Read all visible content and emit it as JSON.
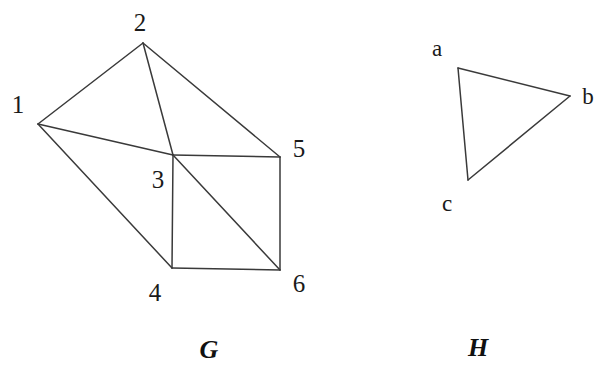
{
  "figure": {
    "background_color": "#ffffff",
    "line_color": "#3a3a3a",
    "text_color": "#1a1a1a",
    "width": 607,
    "height": 384
  },
  "graphs": [
    {
      "id": "G",
      "caption": "G",
      "caption_pos": {
        "x": 209,
        "y": 350
      },
      "vertices": [
        {
          "id": "1",
          "label": "1",
          "x": 38,
          "y": 124,
          "label_x": 18,
          "label_y": 104
        },
        {
          "id": "2",
          "label": "2",
          "x": 143,
          "y": 43,
          "label_x": 140,
          "label_y": 22
        },
        {
          "id": "3",
          "label": "3",
          "x": 173,
          "y": 155,
          "label_x": 158,
          "label_y": 179
        },
        {
          "id": "4",
          "label": "4",
          "x": 172,
          "y": 268,
          "label_x": 155,
          "label_y": 292
        },
        {
          "id": "5",
          "label": "5",
          "x": 280,
          "y": 157,
          "label_x": 299,
          "label_y": 148
        },
        {
          "id": "6",
          "label": "6",
          "x": 280,
          "y": 270,
          "label_x": 299,
          "label_y": 283
        }
      ],
      "edges": [
        {
          "from": "1",
          "to": "2"
        },
        {
          "from": "1",
          "to": "3"
        },
        {
          "from": "1",
          "to": "4"
        },
        {
          "from": "2",
          "to": "3"
        },
        {
          "from": "2",
          "to": "5"
        },
        {
          "from": "3",
          "to": "4"
        },
        {
          "from": "3",
          "to": "5"
        },
        {
          "from": "3",
          "to": "6"
        },
        {
          "from": "4",
          "to": "6"
        },
        {
          "from": "5",
          "to": "6"
        }
      ]
    },
    {
      "id": "H",
      "caption": "H",
      "caption_pos": {
        "x": 478,
        "y": 348
      },
      "vertices": [
        {
          "id": "a",
          "label": "a",
          "x": 458,
          "y": 68,
          "label_x": 437,
          "label_y": 48
        },
        {
          "id": "b",
          "label": "b",
          "x": 570,
          "y": 96,
          "label_x": 588,
          "label_y": 96
        },
        {
          "id": "c",
          "label": "c",
          "x": 468,
          "y": 180,
          "label_x": 447,
          "label_y": 203
        }
      ],
      "edges": [
        {
          "from": "a",
          "to": "b"
        },
        {
          "from": "b",
          "to": "c"
        },
        {
          "from": "c",
          "to": "a"
        }
      ]
    }
  ]
}
